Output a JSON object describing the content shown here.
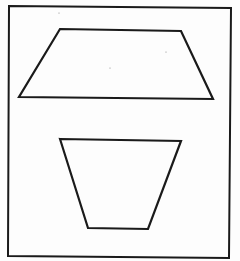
{
  "figure": {
    "width": 240,
    "height": 261,
    "background": "#fdfdfd",
    "stroke_color": "#1a1a1a",
    "frame": {
      "points": "9,6 231,8 229,258 8,256",
      "stroke_width": 2
    },
    "shapes": [
      {
        "name": "top-trapezoid",
        "orientation": "narrow side up",
        "points": "60,29 181,31 213,99 19,97",
        "stroke_width": 2.2
      },
      {
        "name": "bottom-trapezoid",
        "orientation": "narrow side down",
        "points": "60,139 181,141 148,229 88,228",
        "stroke_width": 2.2
      }
    ],
    "specks": [
      {
        "x": 59,
        "y": 13
      },
      {
        "x": 110,
        "y": 68
      },
      {
        "x": 166,
        "y": 52
      }
    ]
  }
}
